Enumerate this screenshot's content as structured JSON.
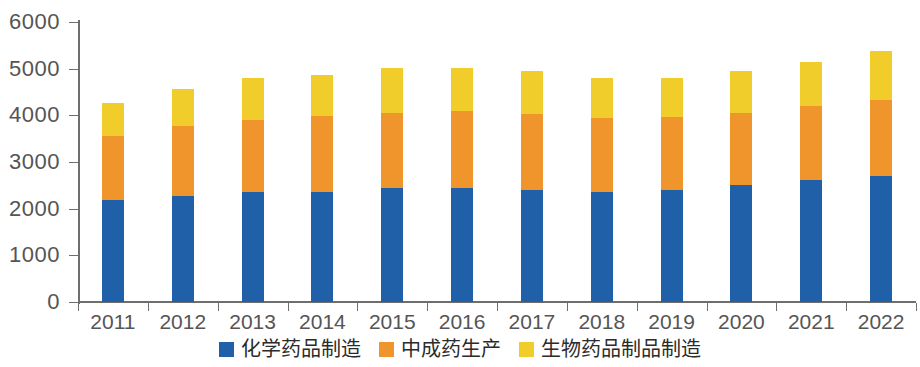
{
  "chart_data": {
    "type": "bar",
    "subtype": "stacked-vertical",
    "title": "",
    "xlabel": "",
    "ylabel": "",
    "ylim": [
      0,
      6000
    ],
    "yticks": [
      0,
      1000,
      2000,
      3000,
      4000,
      5000,
      6000
    ],
    "ytick_labels": [
      "0",
      "1000",
      "2000",
      "3000",
      "4000",
      "5000",
      "6000"
    ],
    "grid": false,
    "legend_position": "bottom-center",
    "categories": [
      "2011",
      "2012",
      "2013",
      "2014",
      "2015",
      "2016",
      "2017",
      "2018",
      "2019",
      "2020",
      "2021",
      "2022"
    ],
    "series": [
      {
        "name": "化学药品制造",
        "color": "#1f60a8",
        "values": [
          2180,
          2270,
          2350,
          2360,
          2450,
          2450,
          2390,
          2350,
          2400,
          2510,
          2620,
          2700
        ]
      },
      {
        "name": "中成药生产",
        "color": "#f0942c",
        "values": [
          1370,
          1500,
          1550,
          1620,
          1610,
          1640,
          1630,
          1600,
          1560,
          1540,
          1590,
          1620
        ]
      },
      {
        "name": "生物药品制品制造",
        "color": "#f0cd2b",
        "values": [
          710,
          790,
          900,
          890,
          950,
          930,
          940,
          850,
          840,
          890,
          940,
          1060
        ]
      }
    ],
    "totals": [
      4260,
      4560,
      4800,
      4870,
      5010,
      5020,
      4960,
      4800,
      4800,
      4940,
      5150,
      5380
    ]
  },
  "legend": {
    "items": [
      {
        "label": "化学药品制造",
        "color": "#1f60a8"
      },
      {
        "label": "中成药生产",
        "color": "#f0942c"
      },
      {
        "label": "生物药品制品制造",
        "color": "#f0cd2b"
      }
    ]
  },
  "axis": {
    "y_labels": [
      "6000",
      "5000",
      "4000",
      "3000",
      "2000",
      "1000",
      "0"
    ],
    "x_labels": [
      "2011",
      "2012",
      "2013",
      "2014",
      "2015",
      "2016",
      "2017",
      "2018",
      "2019",
      "2020",
      "2021",
      "2022"
    ]
  }
}
